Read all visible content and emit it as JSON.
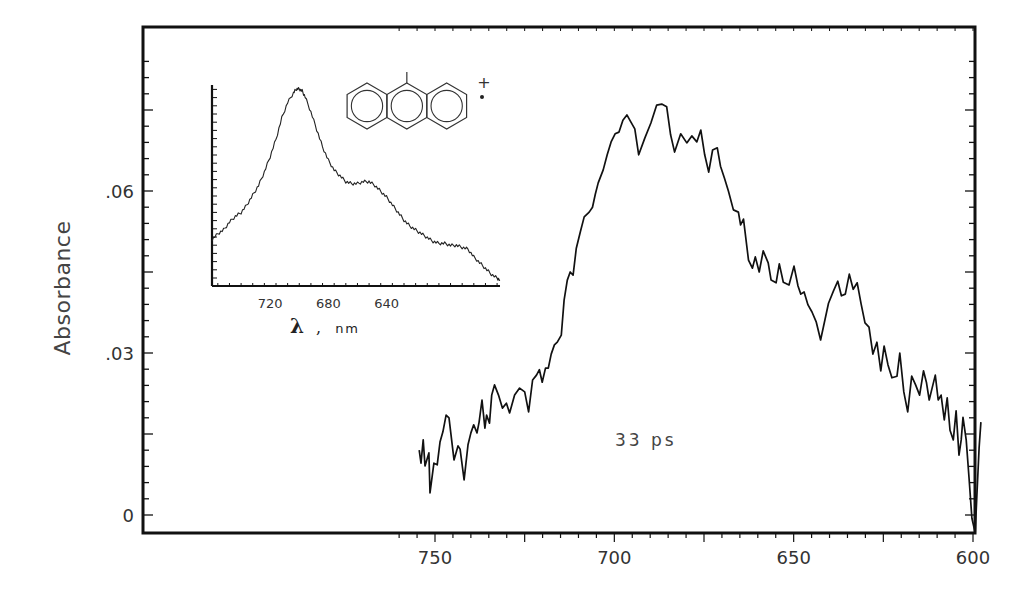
{
  "chart_data": [
    {
      "type": "line",
      "title": "",
      "xlabel": "",
      "ylabel": "Absorbance",
      "x_direction": "reversed",
      "xlim": [
        760,
        600
      ],
      "ylim": [
        -0.0035,
        0.09
      ],
      "x_ticks": [
        750,
        700,
        650,
        600
      ],
      "x_tick_labels": [
        "750",
        "700",
        "650",
        "600"
      ],
      "y_ticks": [
        0,
        0.03,
        0.06
      ],
      "y_tick_labels": [
        "0",
        ".03",
        ".06"
      ],
      "grid": false,
      "annotation": "33 ps",
      "series": [
        {
          "name": "33 ps transient spectrum",
          "x": [
            754.4,
            753.9,
            753.3,
            752.8,
            751.7,
            751.4,
            750.3,
            749.4,
            748.6,
            747.8,
            746.9,
            746.1,
            744.7,
            743.6,
            743.0,
            741.9,
            740.8,
            740.0,
            739.2,
            738.3,
            737.7,
            736.9,
            736.1,
            735.6,
            734.8,
            734.2,
            733.4,
            732.3,
            731.2,
            730.1,
            729.2,
            727.8,
            726.4,
            725.0,
            723.9,
            722.8,
            721.7,
            720.9,
            720.1,
            719.2,
            718.4,
            717.6,
            716.7,
            715.9,
            714.8,
            714.0,
            713.1,
            712.3,
            711.5,
            710.6,
            709.5,
            708.4,
            707.0,
            706.1,
            705.3,
            704.5,
            703.1,
            702.0,
            700.9,
            699.8,
            698.7,
            697.6,
            696.5,
            695.4,
            694.3,
            693.2,
            691.5,
            689.8,
            688.2,
            686.8,
            685.4,
            684.3,
            683.2,
            681.5,
            679.8,
            678.4,
            677.0,
            675.9,
            674.8,
            673.7,
            672.6,
            671.3,
            670.4,
            669.3,
            668.2,
            666.8,
            665.4,
            664.8,
            664.0,
            662.6,
            661.5,
            660.7,
            659.6,
            658.5,
            657.1,
            656.3,
            654.9,
            654.0,
            652.9,
            651.3,
            649.9,
            648.8,
            648.0,
            647.1,
            646.0,
            644.9,
            643.7,
            642.5,
            640.3,
            638.9,
            637.7,
            636.7,
            635.6,
            634.5,
            633.4,
            632.3,
            631.2,
            630.1,
            629.0,
            627.9,
            626.8,
            625.7,
            624.8,
            623.7,
            622.6,
            621.2,
            620.4,
            619.3,
            618.2,
            617.1,
            616.0,
            614.9,
            613.8,
            613.0,
            612.2,
            611.4,
            610.5,
            609.7,
            608.9,
            608.0,
            607.2,
            606.4,
            605.5,
            604.7,
            603.9,
            603.3,
            602.8,
            601.9,
            601.1,
            600.3,
            599.4,
            598.9,
            598.3,
            597.8
          ],
          "y": [
            0.012,
            0.0096,
            0.0139,
            0.0091,
            0.0115,
            0.0041,
            0.0096,
            0.0093,
            0.0135,
            0.0154,
            0.0185,
            0.018,
            0.0102,
            0.0128,
            0.0122,
            0.0065,
            0.013,
            0.0152,
            0.0167,
            0.0152,
            0.0172,
            0.0213,
            0.0161,
            0.0185,
            0.017,
            0.0222,
            0.0241,
            0.0222,
            0.0198,
            0.0207,
            0.0189,
            0.0222,
            0.0235,
            0.0228,
            0.0191,
            0.025,
            0.0259,
            0.0269,
            0.0246,
            0.0272,
            0.0272,
            0.0298,
            0.0315,
            0.032,
            0.0333,
            0.0398,
            0.0435,
            0.045,
            0.0444,
            0.0494,
            0.0524,
            0.0552,
            0.0561,
            0.057,
            0.0594,
            0.0615,
            0.0639,
            0.0667,
            0.0691,
            0.0706,
            0.0709,
            0.0731,
            0.0741,
            0.0728,
            0.0715,
            0.0667,
            0.0698,
            0.0726,
            0.0759,
            0.0761,
            0.0756,
            0.0704,
            0.0672,
            0.0706,
            0.0689,
            0.0702,
            0.0691,
            0.0713,
            0.0667,
            0.0635,
            0.0676,
            0.068,
            0.0646,
            0.0624,
            0.06,
            0.0565,
            0.0561,
            0.0537,
            0.0548,
            0.0472,
            0.0457,
            0.0478,
            0.045,
            0.0489,
            0.0467,
            0.0435,
            0.043,
            0.0465,
            0.0431,
            0.0426,
            0.0461,
            0.0424,
            0.0409,
            0.0413,
            0.0389,
            0.0376,
            0.0357,
            0.0324,
            0.0392,
            0.0415,
            0.0433,
            0.0406,
            0.0409,
            0.0446,
            0.0418,
            0.043,
            0.0391,
            0.0356,
            0.0348,
            0.0298,
            0.032,
            0.0267,
            0.0313,
            0.0278,
            0.0254,
            0.0257,
            0.03,
            0.0228,
            0.0191,
            0.0257,
            0.0241,
            0.0222,
            0.0267,
            0.0246,
            0.0213,
            0.0235,
            0.0259,
            0.0213,
            0.0222,
            0.0176,
            0.0217,
            0.0157,
            0.0139,
            0.0193,
            0.0111,
            0.0139,
            0.0181,
            0.0139,
            0.0067,
            -0.0006,
            -0.0033,
            0.0037,
            0.0124,
            0.0172,
            0.0144,
            0.0028,
            0.0083,
            0.0111
          ]
        }
      ]
    },
    {
      "type": "line",
      "title": "inset",
      "xlabel": "λ , nm",
      "ylabel": "",
      "x_direction": "reversed",
      "xlim": [
        760,
        562
      ],
      "ylim": [
        0,
        1
      ],
      "x_ticks": [
        720,
        680,
        640,
        600
      ],
      "x_tick_labels": [
        "720",
        "680",
        "640",
        ""
      ],
      "y_ticks_unlabeled": true,
      "grid": false,
      "series": [
        {
          "name": "radical cation reference spectrum",
          "x": [
            760,
            756,
            752,
            748,
            744,
            740,
            736,
            732,
            728,
            724,
            720,
            716,
            712,
            708,
            704,
            702,
            700,
            698,
            696,
            692,
            688,
            684,
            680,
            676,
            672,
            668,
            664,
            660,
            656,
            652,
            648,
            644,
            640,
            636,
            632,
            628,
            624,
            620,
            616,
            612,
            608,
            604,
            600,
            596,
            592,
            588,
            584,
            580,
            576,
            572,
            568,
            564,
            562
          ],
          "y": [
            0.22,
            0.25,
            0.27,
            0.31,
            0.34,
            0.36,
            0.4,
            0.45,
            0.5,
            0.57,
            0.65,
            0.74,
            0.85,
            0.93,
            0.98,
            1.0,
            1.0,
            0.99,
            0.96,
            0.88,
            0.79,
            0.7,
            0.63,
            0.58,
            0.55,
            0.52,
            0.51,
            0.51,
            0.52,
            0.52,
            0.5,
            0.47,
            0.44,
            0.4,
            0.36,
            0.32,
            0.29,
            0.27,
            0.25,
            0.23,
            0.21,
            0.2,
            0.2,
            0.19,
            0.19,
            0.18,
            0.17,
            0.13,
            0.1,
            0.07,
            0.04,
            0.02,
            0.01
          ]
        }
      ],
      "structure": {
        "description": "anthracene radical cation with single substituent on central ring",
        "charge_mark": "+",
        "radical_mark": "•"
      }
    }
  ],
  "labels": {
    "y_axis": "Absorbance",
    "annotation": "33 ps",
    "inset_xlabel_symbol": "λ",
    "inset_xlabel_sep": ",",
    "inset_xlabel_unit": "nm"
  },
  "layout": {
    "frame": {
      "left": 143,
      "top": 27,
      "right": 975,
      "bottom": 533
    },
    "main_x_map": {
      "x750": 435,
      "x600": 973
    },
    "main_y_map": {
      "y0": 515,
      "px_per_unit": 5400
    },
    "inset": {
      "left": 212,
      "top": 85,
      "bottom": 286,
      "x760": 212,
      "x562": 500
    },
    "line_color": "#111111"
  }
}
